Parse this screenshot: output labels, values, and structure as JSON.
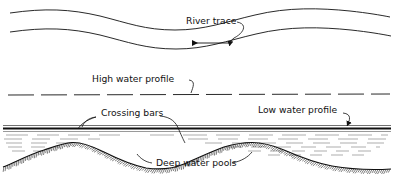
{
  "figure": {
    "background_color": "#ffffff",
    "line_color": "#111111",
    "water_line_color": "#1a1a1a"
  },
  "labels": {
    "river_trace": "River trace",
    "high_water_profile": "High water profile",
    "crossing_bars": "Crossing bars",
    "low_water_profile": "Low water profile",
    "deep_water_pools": "Deep water pools"
  },
  "plan_view": {
    "name": "river-plan-view",
    "flow_arrow_direction": "left",
    "bank_count": 2
  },
  "profile_view": {
    "name": "river-profile-view",
    "bed_features": [
      "crossing bar",
      "deep water pool",
      "crossing bar",
      "deep water pool",
      "crossing bar"
    ],
    "water_surface": "low water",
    "hatching": "ground hatch ticks below bed line"
  },
  "chart_data": {
    "type": "line",
    "xlabel": "",
    "ylabel": "",
    "grid": false,
    "legend": null,
    "series": [
      {
        "name": "North bank (plan)",
        "x": [
          10,
          60,
          110,
          160,
          200,
          250,
          300,
          340,
          388
        ],
        "y": [
          12,
          10,
          16,
          26,
          30,
          26,
          16,
          12,
          16
        ]
      },
      {
        "name": "South bank (plan)",
        "x": [
          10,
          60,
          110,
          160,
          200,
          250,
          300,
          340,
          388
        ],
        "y": [
          30,
          28,
          34,
          44,
          48,
          44,
          34,
          30,
          34
        ]
      },
      {
        "name": "High water profile",
        "x": [
          8,
          388
        ],
        "y": [
          94,
          94
        ],
        "style": "long-dashed horizontal"
      },
      {
        "name": "Low water surface",
        "x": [
          4,
          390
        ],
        "y": [
          128,
          128
        ],
        "style": "solid heavy horizontal"
      },
      {
        "name": "River bed profile",
        "x": [
          4,
          40,
          70,
          105,
          140,
          178,
          215,
          250,
          285,
          320,
          355,
          390
        ],
        "y": [
          166,
          152,
          144,
          151,
          163,
          168,
          160,
          148,
          144,
          152,
          162,
          167
        ],
        "style": "wavy with ground hatching"
      }
    ],
    "annotations": [
      {
        "text": "River trace",
        "x": 186,
        "y": 24,
        "leader_to": [
          229,
          47
        ]
      },
      {
        "text": "High water profile",
        "x": 92,
        "y": 82,
        "leader_to": [
          190,
          94
        ]
      },
      {
        "text": "Crossing bars",
        "x": 101,
        "y": 116,
        "leader_to": [
          88,
          128
        ]
      },
      {
        "text": "Low water profile",
        "x": 258,
        "y": 113,
        "leader_to": [
          343,
          129
        ]
      },
      {
        "text": "Deep water pools",
        "x": 156,
        "y": 165,
        "leader_to": [
          147,
          157
        ]
      }
    ]
  }
}
